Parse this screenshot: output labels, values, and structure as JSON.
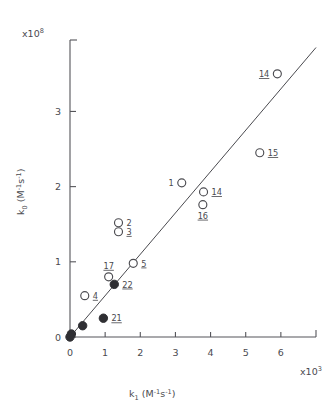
{
  "figure": {
    "background_color": "#ffffff",
    "ink_color": "#4a4a4f"
  },
  "chart_data": {
    "type": "scatter",
    "title": "",
    "subtitle": "",
    "xlabel": "k₁  (M⁻¹s⁻¹)",
    "ylabel": "k₀  (M⁻¹s⁻¹)",
    "x_exponent_label": "x10³",
    "y_exponent_label": "x10⁸",
    "x_scale_multiplier": 1000,
    "y_scale_multiplier": 100000000,
    "xlim": [
      0,
      7.0
    ],
    "ylim": [
      0,
      3.95
    ],
    "xticks": [
      0,
      1,
      2,
      3,
      4,
      5,
      6
    ],
    "yticks": [
      0,
      1,
      2,
      3
    ],
    "xticklabels": [
      "0",
      "1",
      "2",
      "3",
      "4",
      "5",
      "6"
    ],
    "yticklabels": [
      "0",
      "1",
      "2",
      "3"
    ],
    "grid": false,
    "legend": "none",
    "axis_style": "left-and-bottom-spines-with-outward-ticks",
    "fit_line": {
      "label": "",
      "style": "solid",
      "x_start": 0.0,
      "y_start": 0.0,
      "x_end": 7.0,
      "y_end": 3.85
    },
    "marker_types": {
      "open": "open circle",
      "filled": "filled circle"
    },
    "points": [
      {
        "label": "14",
        "underlined": true,
        "x": 5.9,
        "y": 3.5,
        "marker": "open",
        "label_side": "left"
      },
      {
        "label": "15",
        "underlined": true,
        "x": 5.4,
        "y": 2.45,
        "marker": "open",
        "label_side": "right"
      },
      {
        "label": "1",
        "underlined": false,
        "x": 3.18,
        "y": 2.05,
        "marker": "open",
        "label_side": "left"
      },
      {
        "label": "14",
        "underlined": true,
        "x": 3.8,
        "y": 1.93,
        "marker": "open",
        "label_side": "right"
      },
      {
        "label": "16",
        "underlined": true,
        "x": 3.78,
        "y": 1.76,
        "marker": "open",
        "label_side": "below"
      },
      {
        "label": "2",
        "underlined": false,
        "x": 1.38,
        "y": 1.52,
        "marker": "open",
        "label_side": "right"
      },
      {
        "label": "3",
        "underlined": true,
        "x": 1.38,
        "y": 1.4,
        "marker": "open",
        "label_side": "right"
      },
      {
        "label": "5",
        "underlined": true,
        "x": 1.8,
        "y": 0.98,
        "marker": "open",
        "label_side": "right"
      },
      {
        "label": "17",
        "underlined": true,
        "x": 1.1,
        "y": 0.8,
        "marker": "open",
        "label_side": "above"
      },
      {
        "label": "22",
        "underlined": true,
        "x": 1.26,
        "y": 0.7,
        "marker": "filled",
        "label_side": "right"
      },
      {
        "label": "4",
        "underlined": true,
        "x": 0.42,
        "y": 0.55,
        "marker": "open",
        "label_side": "right"
      },
      {
        "label": "21",
        "underlined": true,
        "x": 0.95,
        "y": 0.25,
        "marker": "filled",
        "label_side": "right"
      },
      {
        "label": "",
        "underlined": false,
        "x": 0.36,
        "y": 0.15,
        "marker": "filled",
        "label_side": "none"
      },
      {
        "label": "",
        "underlined": false,
        "x": 0.04,
        "y": 0.04,
        "marker": "filled",
        "label_side": "none"
      },
      {
        "label": "",
        "underlined": false,
        "x": 0.0,
        "y": 0.0,
        "marker": "filled",
        "label_side": "none"
      }
    ]
  }
}
